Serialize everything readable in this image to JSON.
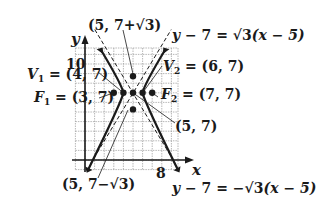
{
  "figure": {
    "type": "hyperbola-graph",
    "axes": {
      "x_label": "x",
      "y_label": "y",
      "x_tick": "8",
      "y_tick": "10"
    },
    "center": {
      "label": "(5, 7)",
      "x": 5,
      "y": 7
    },
    "vertices": [
      {
        "name": "V1",
        "label_main": "V",
        "label_sub": "1",
        "label_rest": " = (4, 7)",
        "x": 4,
        "y": 7
      },
      {
        "name": "V2",
        "label_main": "V",
        "label_sub": "2",
        "label_rest": " = (6, 7)",
        "x": 6,
        "y": 7
      }
    ],
    "foci": [
      {
        "name": "F1",
        "label_main": "F",
        "label_sub": "1",
        "label_rest": " = (3, 7)",
        "x": 3,
        "y": 7
      },
      {
        "name": "F2",
        "label_main": "F",
        "label_sub": "2",
        "label_rest": " = (7, 7)",
        "x": 7,
        "y": 7
      }
    ],
    "conjugate_points": [
      {
        "label_pre": "(5, 7+",
        "label_root": "√3",
        "label_post": ")",
        "x": 5,
        "y": 8.732
      },
      {
        "label_pre": "(5, 7−",
        "label_root": "√3",
        "label_post": ")",
        "x": 5,
        "y": 5.268
      }
    ],
    "asymptotes": [
      {
        "label_pre": "y",
        "label_mid": " − 7 = ",
        "label_root": "√3",
        "label_post": "(x − 5)",
        "slope": 1.732
      },
      {
        "label_pre": "y",
        "label_mid": " − 7 = −",
        "label_root": "√3",
        "label_post": "(x − 5)",
        "slope": -1.732
      }
    ],
    "colors": {
      "ink": "#1a1a1a",
      "grid": "#9a9a9a",
      "background": "#ffffff"
    }
  }
}
